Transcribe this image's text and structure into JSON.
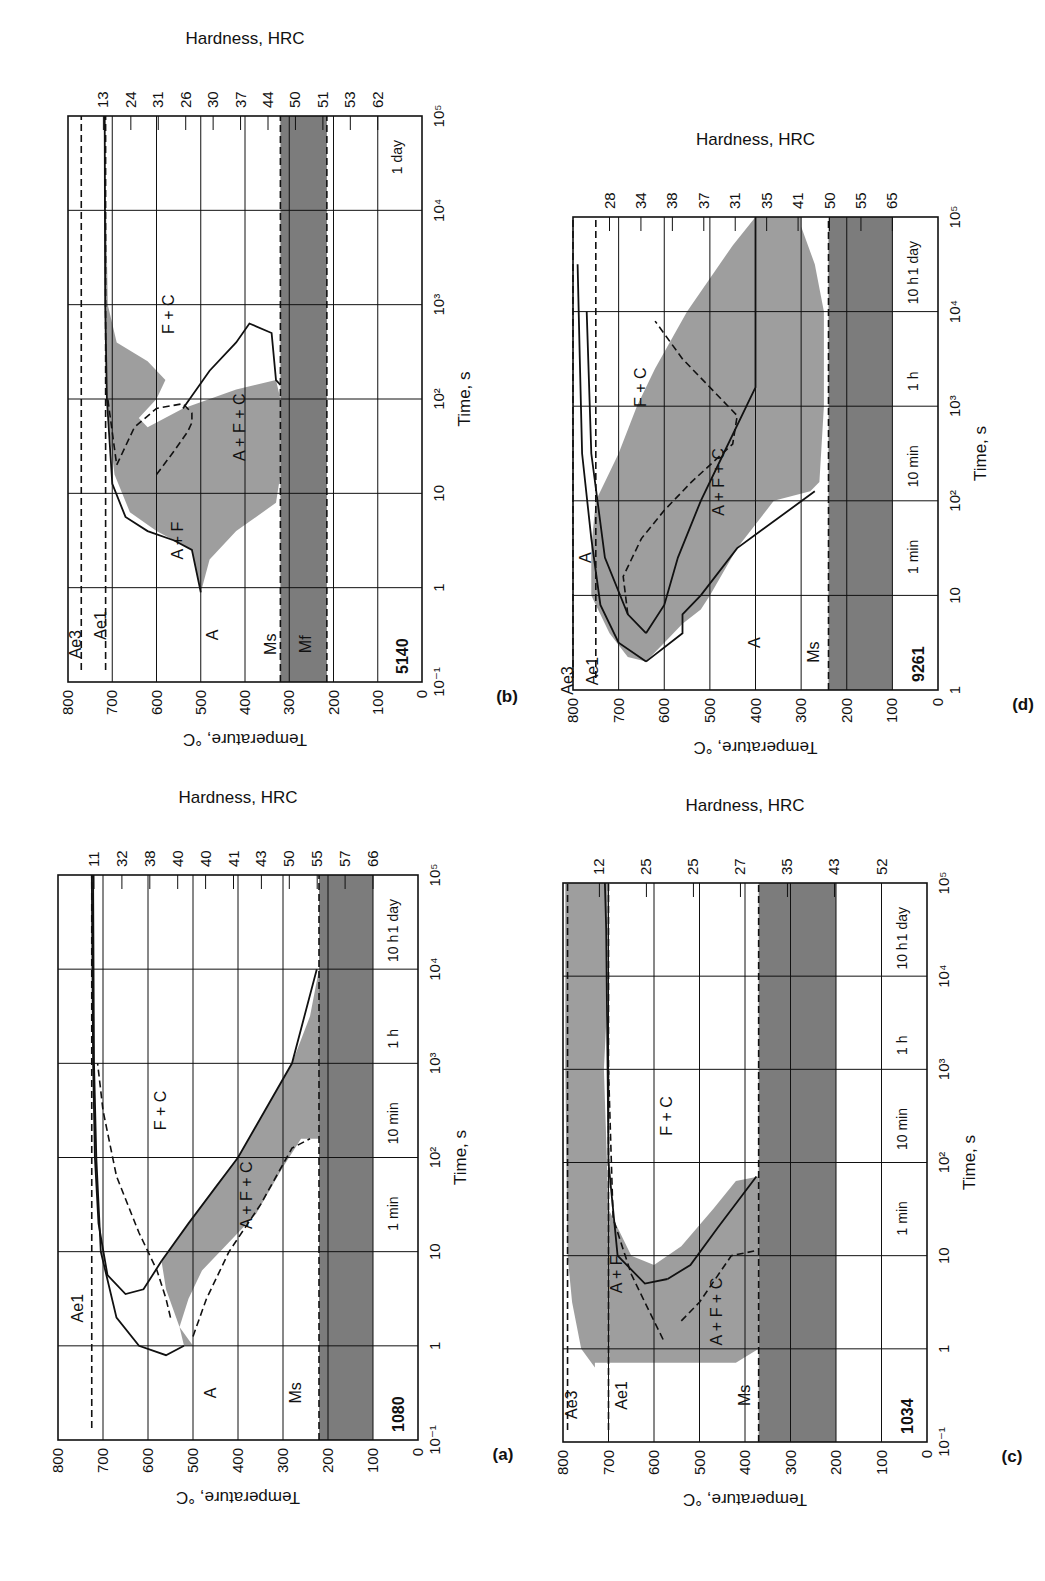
{
  "figure": {
    "panels_note": "Isothermal transformation (TTT) diagrams, page rotated",
    "axis_titles": {
      "temperature": "Temperature, °C",
      "time": "Time, s",
      "hardness": "Hardness, HRC"
    }
  },
  "chart_data": [
    {
      "id": "b",
      "type": "line",
      "caption": "(b)",
      "steel": "5140",
      "title": "5140",
      "xlabel": "Time, s",
      "ylabel": "Temperature, °C",
      "y2label": "Hardness, HRC",
      "xscale": "log",
      "xlim": [
        -1,
        5
      ],
      "xticks": [
        "10⁻¹",
        "1",
        "10",
        "10²",
        "10³",
        "10⁴",
        "10⁵"
      ],
      "ylim": [
        0,
        800
      ],
      "yticks": [
        "0",
        "100",
        "200",
        "300",
        "400",
        "500",
        "600",
        "700",
        "800"
      ],
      "time_marks": [
        "1 day"
      ],
      "hardness": [
        "13",
        "24",
        "31",
        "26",
        "30",
        "37",
        "44",
        "50",
        "51",
        "53",
        "62"
      ],
      "region_labels": [
        "A",
        "A + F",
        "A + F + C",
        "F + C",
        "Ae3",
        "Ae1",
        "Ms",
        "Mf"
      ],
      "lines": {
        "Ae3": 770,
        "Ae1": 715,
        "Ms": 320,
        "Mf": 215
      },
      "start_curve": [
        [
          -0.05,
          500
        ],
        [
          0.4,
          520
        ],
        [
          0.5,
          560
        ],
        [
          0.6,
          620
        ],
        [
          0.75,
          670
        ],
        [
          1.1,
          700
        ],
        [
          2,
          712
        ],
        [
          3,
          716
        ],
        [
          5,
          717
        ]
      ],
      "mid_dash": [
        [
          1.2,
          600
        ],
        [
          1.45,
          560
        ],
        [
          1.65,
          530
        ],
        [
          1.75,
          520
        ],
        [
          1.85,
          520
        ],
        [
          1.95,
          540
        ],
        [
          1.9,
          600
        ],
        [
          1.7,
          650
        ],
        [
          1.3,
          690
        ],
        [
          2,
          710
        ]
      ],
      "finish_curve": [
        [
          0.4,
          500
        ],
        [
          0.6,
          490
        ],
        [
          0.7,
          480
        ],
        [
          0.75,
          440
        ],
        [
          0.85,
          395
        ],
        [
          0.9,
          370
        ],
        [
          0.95,
          360
        ]
      ]
    },
    {
      "id": "d",
      "type": "line",
      "caption": "(d)",
      "steel": "9261",
      "title": "9261",
      "xlabel": "Time, s",
      "ylabel": "Temperature, °C",
      "y2label": "Hardness, HRC",
      "xscale": "log",
      "xlim": [
        0,
        5
      ],
      "xticks": [
        "1",
        "10",
        "10²",
        "10³",
        "10⁴",
        "10⁵"
      ],
      "ylim": [
        0,
        800
      ],
      "yticks": [
        "0",
        "100",
        "200",
        "300",
        "400",
        "500",
        "600",
        "700",
        "800"
      ],
      "time_marks": [
        "1 min",
        "10 min",
        "1 h",
        "10 h",
        "1 day"
      ],
      "hardness": [
        "28",
        "34",
        "38",
        "37",
        "31",
        "35",
        "41",
        "50",
        "55",
        "65"
      ],
      "region_labels": [
        "A",
        "A",
        "A + F + C",
        "F + C",
        "Ae3",
        "Ae1",
        "Ms"
      ],
      "lines": {
        "Ae3": 800,
        "Ae1": 750,
        "Ms": 240
      }
    },
    {
      "id": "a",
      "type": "line",
      "caption": "(a)",
      "steel": "1080",
      "title": "1080",
      "xlabel": "Time, s",
      "ylabel": "Temperature, °C",
      "y2label": "Hardness, HRC",
      "xscale": "log",
      "xlim": [
        -1,
        5
      ],
      "xticks": [
        "10⁻¹",
        "1",
        "10",
        "10²",
        "10³",
        "10⁴",
        "10⁵"
      ],
      "ylim": [
        0,
        800
      ],
      "yticks": [
        "0",
        "100",
        "200",
        "300",
        "400",
        "500",
        "600",
        "700",
        "800"
      ],
      "time_marks": [
        "1 min",
        "10 min",
        "1 h",
        "10 h",
        "1 day"
      ],
      "hardness": [
        "11",
        "32",
        "38",
        "40",
        "40",
        "41",
        "43",
        "50",
        "55",
        "57",
        "66"
      ],
      "region_labels": [
        "A",
        "A + F + C",
        "F + C",
        "Ae1",
        "Ms"
      ],
      "lines": {
        "Ae1": 725,
        "Ms": 220
      }
    },
    {
      "id": "c",
      "type": "line",
      "caption": "(c)",
      "steel": "1034",
      "title": "1034",
      "xlabel": "Time, s",
      "ylabel": "Temperature, °C",
      "y2label": "Hardness, HRC",
      "xscale": "log",
      "xlim": [
        -1,
        5
      ],
      "xticks": [
        "10⁻¹",
        "1",
        "10",
        "10²",
        "10³",
        "10⁴",
        "10⁵"
      ],
      "ylim": [
        0,
        800
      ],
      "yticks": [
        "0",
        "100",
        "200",
        "300",
        "400",
        "500",
        "600",
        "700",
        "800"
      ],
      "time_marks": [
        "1 min",
        "10 min",
        "1 h",
        "10 h",
        "1 day"
      ],
      "hardness": [
        "12",
        "25",
        "25",
        "27",
        "35",
        "43",
        "52"
      ],
      "region_labels": [
        "A + F",
        "A + F + C",
        "F + C",
        "Ae3",
        "Ae1",
        "Ms"
      ],
      "lines": {
        "Ae3": 790,
        "Ae1": 700,
        "Ms": 370
      }
    }
  ]
}
